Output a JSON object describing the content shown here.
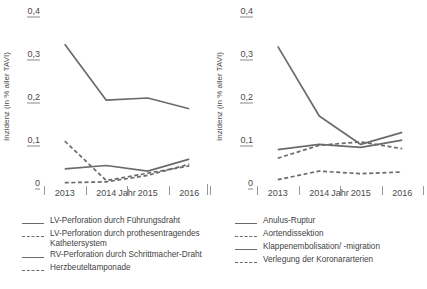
{
  "figure": {
    "width": 427,
    "height": 289,
    "line_color": "#6b6b6b",
    "text_color": "#3f3f3f",
    "axis_color": "#9a9a9a"
  },
  "chart_data": [
    {
      "type": "line",
      "panel": "left",
      "title": "",
      "xlabel": "Jahr",
      "ylabel": "Inzidenz (in % aller TAVI)",
      "categories": [
        "2013",
        "2014",
        "2015",
        "2016"
      ],
      "ytick_labels": [
        "0,4",
        "0,3",
        "0,2",
        "0,1",
        "0"
      ],
      "ytick_values": [
        0.4,
        0.3,
        0.2,
        0.1,
        0
      ],
      "ylim": [
        0,
        0.4
      ],
      "grid": false,
      "legend_position": "below",
      "series": [
        {
          "name": "LV-Perforation durch Führungsdraht",
          "style": "solid",
          "values": [
            0.325,
            0.195,
            0.2,
            0.175
          ]
        },
        {
          "name": "LV-Perforation durch prothesentragendes Kathetersystem",
          "style": "dashed",
          "values": [
            0.1,
            0.008,
            0.025,
            0.042
          ]
        },
        {
          "name": "RV-Perforation durch Schrittmacher-Draht",
          "style": "solid",
          "values": [
            0.035,
            0.043,
            0.03,
            0.058
          ]
        },
        {
          "name": "Herzbeuteltamponade",
          "style": "dashed",
          "values": [
            0.003,
            0.005,
            0.02,
            0.046
          ]
        }
      ]
    },
    {
      "type": "line",
      "panel": "right",
      "title": "",
      "xlabel": "Jahr",
      "ylabel": "Inzidenz (in % aller TAVI)",
      "categories": [
        "2013",
        "2014",
        "2015",
        "2016"
      ],
      "ytick_labels": [
        "0,4",
        "0,3",
        "0,2",
        "0,1",
        "0"
      ],
      "ytick_values": [
        0.4,
        0.3,
        0.2,
        0.1,
        0
      ],
      "ylim": [
        0,
        0.4
      ],
      "grid": false,
      "legend_position": "below",
      "series": [
        {
          "name": "Anulus-Ruptur",
          "style": "solid",
          "values": [
            0.32,
            0.158,
            0.092,
            0.12
          ]
        },
        {
          "name": "Aortendissektion",
          "style": "dashed",
          "values": [
            0.06,
            0.09,
            0.098,
            0.082
          ]
        },
        {
          "name": "Klappenembolisation/ -migration",
          "style": "solid",
          "values": [
            0.08,
            0.092,
            0.085,
            0.102
          ]
        },
        {
          "name": "Verlegung der Koronararterien",
          "style": "dashed",
          "values": [
            0.01,
            0.03,
            0.024,
            0.028
          ]
        }
      ]
    }
  ]
}
